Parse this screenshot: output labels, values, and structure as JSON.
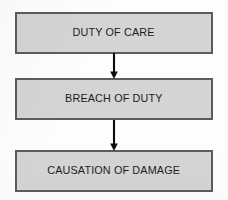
{
  "diagram": {
    "orientation": "vertical-top-down",
    "background_color": "#fdfdfc",
    "node_fill_color": "#d4d4d4",
    "node_border_color": "#5c5c5c",
    "text_color": "#1c1c1c",
    "arrow_color": "#0d0d0d",
    "nodes": [
      {
        "id": "duty",
        "label": "DUTY OF CARE"
      },
      {
        "id": "breach",
        "label": "BREACH OF DUTY"
      },
      {
        "id": "causation",
        "label": "CAUSATION OF DAMAGE"
      }
    ],
    "connectors": [
      {
        "id": "duty-to-breach",
        "from": "duty",
        "to": "breach",
        "type": "arrow-down"
      },
      {
        "id": "breach-to-causation",
        "from": "breach",
        "to": "causation",
        "type": "arrow-down"
      }
    ]
  }
}
